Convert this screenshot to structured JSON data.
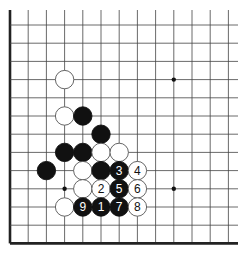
{
  "diagram": {
    "type": "go-board-fragment",
    "columns": 13,
    "rows": 13,
    "edges": {
      "left": true,
      "bottom": true,
      "top": false,
      "right": false
    },
    "colors": {
      "black": "#111111",
      "white": "#ffffff",
      "line": "#444444",
      "edge": "#222222"
    },
    "star_points": [
      {
        "col": 9,
        "row": 3
      },
      {
        "col": 3,
        "row": 9
      },
      {
        "col": 9,
        "row": 9
      }
    ],
    "stones": [
      {
        "col": 3,
        "row": 3,
        "color": "white",
        "label": ""
      },
      {
        "col": 3,
        "row": 5,
        "color": "white",
        "label": ""
      },
      {
        "col": 4,
        "row": 5,
        "color": "black",
        "label": ""
      },
      {
        "col": 5,
        "row": 6,
        "color": "black",
        "label": ""
      },
      {
        "col": 3,
        "row": 7,
        "color": "black",
        "label": ""
      },
      {
        "col": 4,
        "row": 7,
        "color": "black",
        "label": ""
      },
      {
        "col": 5,
        "row": 7,
        "color": "white",
        "label": ""
      },
      {
        "col": 6,
        "row": 7,
        "color": "white",
        "label": ""
      },
      {
        "col": 2,
        "row": 8,
        "color": "black",
        "label": ""
      },
      {
        "col": 4,
        "row": 8,
        "color": "white",
        "label": ""
      },
      {
        "col": 5,
        "row": 8,
        "color": "black",
        "label": ""
      },
      {
        "col": 6,
        "row": 8,
        "color": "black",
        "label": "3"
      },
      {
        "col": 7,
        "row": 8,
        "color": "white",
        "label": "4"
      },
      {
        "col": 4,
        "row": 9,
        "color": "white",
        "label": ""
      },
      {
        "col": 5,
        "row": 9,
        "color": "white",
        "label": "2"
      },
      {
        "col": 6,
        "row": 9,
        "color": "black",
        "label": "5"
      },
      {
        "col": 7,
        "row": 9,
        "color": "white",
        "label": "6"
      },
      {
        "col": 3,
        "row": 10,
        "color": "white",
        "label": ""
      },
      {
        "col": 4,
        "row": 10,
        "color": "black",
        "label": "9"
      },
      {
        "col": 5,
        "row": 10,
        "color": "black",
        "label": "1"
      },
      {
        "col": 6,
        "row": 10,
        "color": "black",
        "label": "7"
      },
      {
        "col": 7,
        "row": 10,
        "color": "white",
        "label": "8"
      }
    ]
  }
}
